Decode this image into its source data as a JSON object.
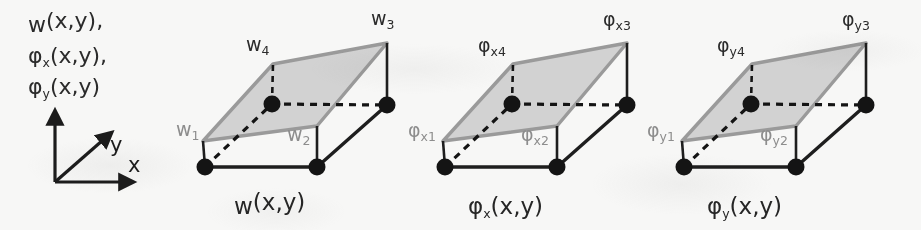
{
  "figure": {
    "name": "plate-element-dof-fields",
    "background_color": "#f7f7f6",
    "surface_fill": "#d2d2d2",
    "surface_edge_color": "#9a9a9a",
    "base_edge_color": "#1e1e1e",
    "node_color": "#141414",
    "dashed_color": "#141414",
    "label_dark_color": "#2b2b2b",
    "label_gray_color": "#8d8d8d"
  },
  "legend": {
    "name": "field-variable-list",
    "lines": [
      {
        "base": "w",
        "sub": "",
        "args": "(x,y),"
      },
      {
        "base": "φ",
        "sub": "x",
        "args": "(x,y),"
      },
      {
        "base": "φ",
        "sub": "y",
        "args": "(x,y)"
      }
    ]
  },
  "axes": {
    "name": "coordinate-triad",
    "labels": {
      "x": "x",
      "y": "y",
      "vertical": ""
    },
    "origin": [
      55,
      182
    ]
  },
  "panels": [
    {
      "id": "w",
      "caption": {
        "base": "w",
        "sub": "",
        "args": "(x,y)"
      },
      "nodes": [
        {
          "id": "n1",
          "label_base": "w",
          "label_sub": "1",
          "label_color": "gray",
          "corner": "front-left"
        },
        {
          "id": "n2",
          "label_base": "w",
          "label_sub": "2",
          "label_color": "gray",
          "corner": "front-right"
        },
        {
          "id": "n3",
          "label_base": "w",
          "label_sub": "3",
          "label_color": "dark",
          "corner": "back-right"
        },
        {
          "id": "n4",
          "label_base": "w",
          "label_sub": "4",
          "label_color": "dark",
          "corner": "back-left"
        }
      ]
    },
    {
      "id": "phi-x",
      "caption": {
        "base": "φ",
        "sub": "x",
        "args": "(x,y)"
      },
      "nodes": [
        {
          "id": "n1",
          "label_base": "φ",
          "label_sub": "x1",
          "label_color": "gray",
          "corner": "front-left"
        },
        {
          "id": "n2",
          "label_base": "φ",
          "label_sub": "x2",
          "label_color": "gray",
          "corner": "front-right"
        },
        {
          "id": "n3",
          "label_base": "φ",
          "label_sub": "x3",
          "label_color": "dark",
          "corner": "back-right"
        },
        {
          "id": "n4",
          "label_base": "φ",
          "label_sub": "x4",
          "label_color": "dark",
          "corner": "back-left"
        }
      ]
    },
    {
      "id": "phi-y",
      "caption": {
        "base": "φ",
        "sub": "y",
        "args": "(x,y)"
      },
      "nodes": [
        {
          "id": "n1",
          "label_base": "φ",
          "label_sub": "y1",
          "label_color": "gray",
          "corner": "front-left"
        },
        {
          "id": "n2",
          "label_base": "φ",
          "label_sub": "y2",
          "label_color": "gray",
          "corner": "front-right"
        },
        {
          "id": "n3",
          "label_base": "φ",
          "label_sub": "y3",
          "label_color": "dark",
          "corner": "back-right"
        },
        {
          "id": "n4",
          "label_base": "φ",
          "label_sub": "y4",
          "label_color": "dark",
          "corner": "back-left"
        }
      ]
    }
  ]
}
